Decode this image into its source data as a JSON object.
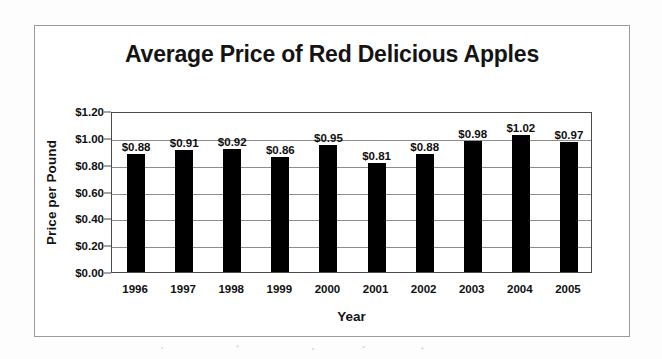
{
  "chart_data": {
    "type": "bar",
    "title": "Average Price of Red Delicious Apples",
    "xlabel": "Year",
    "ylabel": "Price per Pound",
    "categories": [
      "1996",
      "1997",
      "1998",
      "1999",
      "2000",
      "2001",
      "2002",
      "2003",
      "2004",
      "2005"
    ],
    "values": [
      0.88,
      0.91,
      0.92,
      0.86,
      0.95,
      0.81,
      0.88,
      0.98,
      1.02,
      0.97
    ],
    "data_labels": [
      "$0.88",
      "$0.91",
      "$0.92",
      "$0.86",
      "$0.95",
      "$0.81",
      "$0.88",
      "$0.98",
      "$1.02",
      "$0.97"
    ],
    "ylim": [
      0,
      1.2
    ],
    "ytick_values": [
      0.0,
      0.2,
      0.4,
      0.6,
      0.8,
      1.0,
      1.2
    ],
    "ytick_labels": [
      "$0.00",
      "$0.20",
      "$0.40",
      "$0.60",
      "$0.80",
      "$1.00",
      "$1.20"
    ],
    "grid": "horizontal",
    "legend": "none",
    "bar_color": "#000000",
    "plot_background": "#ffffff",
    "gridline_color": "#8d8d8d",
    "axis_color": "#4a4a4a",
    "frame_color": "#9a9a9a"
  }
}
